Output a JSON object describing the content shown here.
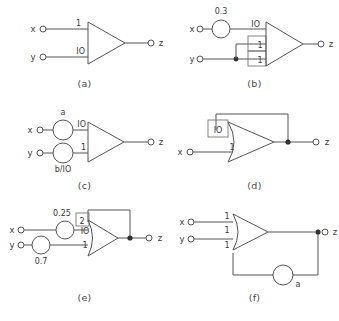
{
  "figure": {
    "type": "diagram",
    "panel_count": 6
  },
  "panels": [
    {
      "id": "a",
      "caption": "(a)",
      "inputs": [
        {
          "label": "x",
          "weight": "1"
        },
        {
          "label": "y",
          "weight": "IO"
        }
      ],
      "outputs": [
        {
          "label": "z"
        }
      ],
      "circles": [],
      "feedback": null
    },
    {
      "id": "b",
      "caption": "(b)",
      "inputs": [
        {
          "label": "x",
          "weight": "IO"
        },
        {
          "label": "",
          "weight": "1"
        },
        {
          "label": "y",
          "weight": "1"
        }
      ],
      "outputs": [
        {
          "label": "z"
        }
      ],
      "circles": [
        {
          "label": "0.3",
          "on": "x"
        }
      ],
      "feedback": null
    },
    {
      "id": "c",
      "caption": "(c)",
      "inputs": [
        {
          "label": "x",
          "weight": "IO"
        },
        {
          "label": "y",
          "weight": "1"
        }
      ],
      "outputs": [
        {
          "label": "z"
        }
      ],
      "circles": [
        {
          "label": "a",
          "on": "x"
        },
        {
          "label": "b/IO",
          "on": "y"
        }
      ],
      "feedback": null
    },
    {
      "id": "d",
      "caption": "(d)",
      "inputs": [
        {
          "label": "",
          "weight": "IO"
        },
        {
          "label": "x",
          "weight": "1"
        }
      ],
      "outputs": [
        {
          "label": "z"
        }
      ],
      "circles": [],
      "feedback": {
        "from": "z",
        "to_weight": "IO"
      }
    },
    {
      "id": "e",
      "caption": "(e)",
      "inputs": [
        {
          "label": "",
          "weight": "2"
        },
        {
          "label": "x",
          "weight": "IO"
        },
        {
          "label": "y",
          "weight": "1"
        }
      ],
      "outputs": [
        {
          "label": "z"
        }
      ],
      "circles": [
        {
          "label": "0.25",
          "on": "x"
        },
        {
          "label": "0.7",
          "on": "y"
        }
      ],
      "feedback": {
        "from": "z",
        "to_weight": "2"
      }
    },
    {
      "id": "f",
      "caption": "(f)",
      "inputs": [
        {
          "label": "x",
          "weight": "1"
        },
        {
          "label": "y",
          "weight": "1"
        },
        {
          "label": "",
          "weight": "1"
        }
      ],
      "outputs": [
        {
          "label": "z"
        }
      ],
      "circles": [
        {
          "label": "a",
          "on": "feedback"
        }
      ],
      "feedback": {
        "from": "z",
        "to_weight": "1",
        "through": "a"
      }
    }
  ],
  "colors": {
    "line": "#555555",
    "text": "#3a3a3a",
    "caption": "#4a4a4a",
    "background": "#ffffff",
    "junction": "#303030"
  }
}
